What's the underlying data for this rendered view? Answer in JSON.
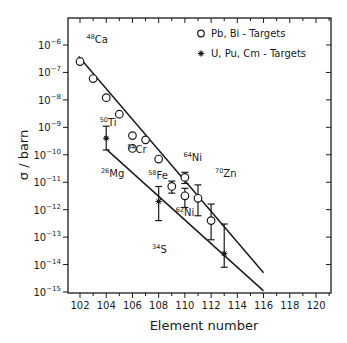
{
  "chart_data": {
    "type": "scatter",
    "title": "",
    "xlabel": "Element number",
    "ylabel": "σ / barn",
    "xlim": [
      101,
      121
    ],
    "ylim_log10": [
      -15,
      -5.3
    ],
    "yscale": "log",
    "x_ticks": [
      102,
      104,
      106,
      108,
      110,
      112,
      114,
      116,
      118,
      120
    ],
    "y_ticks_exponents": [
      -6,
      -7,
      -8,
      -9,
      -10,
      -11,
      -12,
      -13,
      -14,
      -15
    ],
    "y_tick_base": "10",
    "legend": {
      "position": "top-right",
      "entries": [
        {
          "marker": "open-circle",
          "label": "Pb, Bi - Targets"
        },
        {
          "marker": "star",
          "label": "U, Pu, Cm - Targets"
        }
      ]
    },
    "series": [
      {
        "name": "Pb, Bi - Targets",
        "marker": "open-circle",
        "points": [
          {
            "x": 102,
            "y": 2.5e-07
          },
          {
            "x": 103,
            "y": 6e-08
          },
          {
            "x": 104,
            "y": 1.2e-08
          },
          {
            "x": 105,
            "y": 3e-09
          },
          {
            "x": 106,
            "y": 5e-10
          },
          {
            "x": 106,
            "y": 1.7e-10
          },
          {
            "x": 107,
            "y": 3.5e-10
          },
          {
            "x": 108,
            "y": 7e-11
          },
          {
            "x": 109,
            "y": 7e-12,
            "err_low": 4e-12,
            "err_high": 1.1e-11
          },
          {
            "x": 110,
            "y": 1.5e-11,
            "err_low": 9e-12,
            "err_high": 2.3e-11
          },
          {
            "x": 110,
            "y": 3.2e-12,
            "err_low": 1.2e-12,
            "err_high": 6e-12
          },
          {
            "x": 111,
            "y": 2.6e-12,
            "err_low": 6e-13,
            "err_high": 8e-12
          },
          {
            "x": 112,
            "y": 4e-13,
            "err_low": 8e-14,
            "err_high": 1.6e-12
          }
        ]
      },
      {
        "name": "U, Pu, Cm - Targets",
        "marker": "star",
        "points": [
          {
            "x": 104,
            "y": 4e-10,
            "err_low": 1.5e-10,
            "err_high": 1.1e-09
          },
          {
            "x": 108,
            "y": 2e-12,
            "err_low": 4e-13,
            "err_high": 7e-12
          },
          {
            "x": 113,
            "y": 2.5e-14,
            "err_low": 8e-15,
            "err_high": 3e-13
          }
        ]
      }
    ],
    "fit_lines": [
      {
        "name": "upper",
        "from": {
          "x": 101.9,
          "y": 3.8e-07
        },
        "to": {
          "x": 116,
          "y": 5e-15
        }
      },
      {
        "name": "lower",
        "from": {
          "x": 104,
          "y": 1.6e-10
        },
        "to": {
          "x": 116,
          "y": 1.1e-15
        }
      }
    ],
    "annotations": [
      {
        "sup": "48",
        "text": "Ca",
        "x": 102.5,
        "y": 1.2e-06
      },
      {
        "sup": "50",
        "text": "Ti",
        "x": 103.5,
        "y": 1.1e-09
      },
      {
        "sup": "54",
        "text": "Cr",
        "x": 105.6,
        "y": 1.2e-10
      },
      {
        "sup": "26",
        "text": "Mg",
        "x": 103.6,
        "y": 1.5e-11
      },
      {
        "sup": "58",
        "text": "Fe",
        "x": 107.2,
        "y": 1.3e-11
      },
      {
        "sup": "64",
        "text": "Ni",
        "x": 109.9,
        "y": 6e-11
      },
      {
        "sup": "70",
        "text": "Zn",
        "x": 112.3,
        "y": 1.6e-11
      },
      {
        "sup": "62",
        "text": "Ni",
        "x": 109.3,
        "y": 6e-13
      },
      {
        "sup": "34",
        "text": "S",
        "x": 107.5,
        "y": 2.7e-14
      }
    ]
  }
}
